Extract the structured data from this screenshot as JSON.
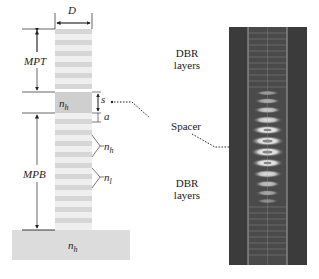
{
  "figure": {
    "left_panel": {
      "width_label": "D",
      "top_mirror_label": "MPT",
      "bottom_mirror_label": "MPB",
      "spacer_index": {
        "base": "n",
        "sub": "h"
      },
      "spacer_thickness_label": "s",
      "layer_thickness_label": "a",
      "high_index_label": {
        "base": "n",
        "sub": "h"
      },
      "low_index_label": {
        "base": "n",
        "sub": "l"
      },
      "substrate_index": {
        "base": "n",
        "sub": "h"
      }
    },
    "middle_labels": {
      "top_dbr": [
        "DBR",
        "layers"
      ],
      "spacer": "Spacer",
      "bottom_dbr": [
        "DBR",
        "layers"
      ]
    },
    "right_panel": {
      "description": "simulated field intensity profile image",
      "colors": {
        "background": "#3a3a3a",
        "highlight": "#f2f2f2"
      }
    },
    "colors": {
      "pillar_layer": "#d9d9d9",
      "spacer": "#cfcfcf",
      "substrate": "#dcdcdc",
      "line": "#222222"
    }
  }
}
